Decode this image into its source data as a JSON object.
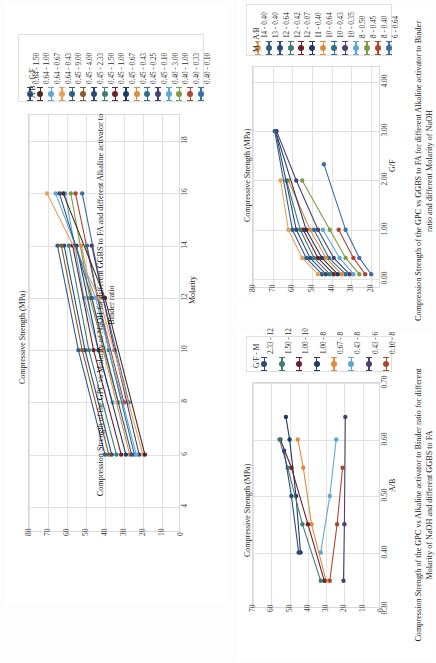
{
  "page": {
    "background": "#ffffff",
    "orientation": "rotated-90",
    "palette": [
      "#3a6fa8",
      "#b0442e",
      "#7e9b46",
      "#5fa8d3",
      "#4b3f72",
      "#2f6d8e",
      "#e08a3c",
      "#1f3b63",
      "#6e1f2a",
      "#3d7d74",
      "#2d4a7a",
      "#8a5a2b",
      "#2e5f8a",
      "#a23d2e",
      "#6b8f3a",
      "#79add6",
      "#e8a05c",
      "#4a2d1f",
      "#35538a",
      "#5ea0c9"
    ]
  },
  "chart_data": [
    {
      "id": "chart-1",
      "type": "line",
      "title": "",
      "caption": "Compression Strength of the GPC vs Molarity of NaOH for different GGBS to FA and different Alkaline activator to Binder ratio",
      "xlabel": "Molarity",
      "ylabel": "Compressive Strength (MPa)",
      "xticks": [
        4,
        6,
        8,
        10,
        12,
        14,
        16,
        18
      ],
      "yticks": [
        0,
        10,
        20,
        30,
        40,
        50,
        60,
        70,
        80
      ],
      "xlim": [
        3,
        19
      ],
      "ylim": [
        0,
        80
      ],
      "grid": true,
      "legend_title": "A/B - G/F",
      "legend_position": "top",
      "series": [
        {
          "name": "0.40 - 0.10",
          "color": "#3a6fa8",
          "x": [
            8,
            12,
            16
          ],
          "y": [
            27.5,
            41.0,
            52.0
          ]
        },
        {
          "name": "0.40 - 0.33",
          "color": "#b0442e",
          "x": [
            8,
            12,
            16
          ],
          "y": [
            30.0,
            44.0,
            55.5
          ]
        },
        {
          "name": "0.40 - 1.00",
          "color": "#7e9b46",
          "x": [
            8,
            12,
            16
          ],
          "y": [
            33.0,
            48.0,
            58.0
          ]
        },
        {
          "name": "0.40 - 3.00",
          "color": "#5fa8d3",
          "x": [
            8,
            12,
            16
          ],
          "y": [
            36.0,
            51.0,
            61.0
          ]
        },
        {
          "name": "0.45 - 0.10",
          "color": "#4b3f72",
          "x": [
            6,
            10,
            14
          ],
          "y": [
            22.0,
            35.0,
            47.0
          ]
        },
        {
          "name": "0.45 - 0.25",
          "color": "#2f6d8e",
          "x": [
            6,
            10,
            14
          ],
          "y": [
            24.5,
            38.0,
            49.5
          ]
        },
        {
          "name": "0.45 - 0.43",
          "color": "#e08a3c",
          "x": [
            6,
            10,
            14
          ],
          "y": [
            27.0,
            41.0,
            52.5
          ]
        },
        {
          "name": "0.45 - 0.67",
          "color": "#1f3b63",
          "x": [
            6,
            10,
            14
          ],
          "y": [
            29.0,
            43.5,
            55.0
          ]
        },
        {
          "name": "0.45 - 1.00",
          "color": "#6e1f2a",
          "x": [
            6,
            10,
            14
          ],
          "y": [
            31.5,
            46.0,
            57.0
          ]
        },
        {
          "name": "0.45 - 1.50",
          "color": "#3d7d74",
          "x": [
            6,
            10,
            14
          ],
          "y": [
            34.0,
            48.5,
            59.0
          ]
        },
        {
          "name": "0.45 - 2.33",
          "color": "#2d4a7a",
          "x": [
            6,
            10,
            14
          ],
          "y": [
            36.5,
            50.5,
            61.5
          ]
        },
        {
          "name": "0.45 - 4.00",
          "color": "#8a5a2b",
          "x": [
            6,
            10,
            14
          ],
          "y": [
            38.0,
            52.0,
            63.0
          ]
        },
        {
          "name": "0.45 - 9.00",
          "color": "#2e5f8a",
          "x": [
            6,
            10,
            14
          ],
          "y": [
            40.0,
            54.0,
            65.0
          ]
        },
        {
          "name": "0.64 - 0.43",
          "color": "#e8a05c",
          "x": [
            6,
            12,
            16
          ],
          "y": [
            20.0,
            43.0,
            70.5
          ]
        },
        {
          "name": "0.64 - 0.67",
          "color": "#5fa8d3",
          "x": [
            6,
            12,
            16
          ],
          "y": [
            23.5,
            45.0,
            66.0
          ]
        },
        {
          "name": "0.64 - 1.00",
          "color": "#4a2d1f",
          "x": [
            6,
            12,
            16
          ],
          "y": [
            19.0,
            40.0,
            62.0
          ]
        },
        {
          "name": "0.64 - 1.50",
          "color": "#35538a",
          "x": [
            6,
            12,
            16
          ],
          "y": [
            26.0,
            47.0,
            64.0
          ]
        }
      ]
    },
    {
      "id": "chart-2",
      "type": "line",
      "title": "",
      "caption": "Compression Strength of the GPC vs GGBS to FA for different Alkaline activator to Binder ratio and different Molarity of NaOH",
      "xlabel": "G/F",
      "ylabel": "Compressive Strength (MPa)",
      "xticks": [
        "0.00",
        "1.00",
        "2.00",
        "3.00",
        "4.00"
      ],
      "yticks": [
        20,
        30,
        40,
        50,
        60,
        70,
        80
      ],
      "xlim": [
        -0.2,
        4.3
      ],
      "ylim": [
        15,
        80
      ],
      "grid": true,
      "legend_title": "M - A/B",
      "legend_position": "top",
      "series": [
        {
          "name": "6 - 0.64",
          "color": "#3a6fa8",
          "x": [
            0.1,
            0.43,
            1.0,
            2.33
          ],
          "y": [
            20.0,
            26.0,
            33.0,
            44.0
          ]
        },
        {
          "name": "8 - 0.40",
          "color": "#b0442e",
          "x": [
            0.1,
            0.43,
            1.0
          ],
          "y": [
            23.0,
            29.0,
            36.5
          ]
        },
        {
          "name": "8 - 0.45",
          "color": "#7e9b46",
          "x": [
            0.1,
            0.43,
            1.0,
            2.0
          ],
          "y": [
            26.0,
            33.0,
            41.0,
            55.0
          ]
        },
        {
          "name": "8 - 0.50",
          "color": "#5fa8d3",
          "x": [
            0.1,
            0.43,
            1.0
          ],
          "y": [
            29.0,
            36.0,
            44.5
          ]
        },
        {
          "name": "10 - 0.35",
          "color": "#4b3f72",
          "x": [
            0.1,
            0.43,
            1.0,
            2.0,
            3.0
          ],
          "y": [
            31.0,
            39.0,
            47.0,
            58.0,
            68.0
          ]
        },
        {
          "name": "10 - 0.43",
          "color": "#2f6d8e",
          "x": [
            0.1,
            0.43,
            1.0
          ],
          "y": [
            33.0,
            41.5,
            49.0
          ]
        },
        {
          "name": "10 - 0.64",
          "color": "#e08a3c",
          "x": [
            0.1,
            0.43,
            1.0,
            2.0
          ],
          "y": [
            35.0,
            43.0,
            51.0,
            62.0
          ]
        },
        {
          "name": "11 - 0.40",
          "color": "#1f3b63",
          "x": [
            0.1,
            0.43,
            1.0,
            3.0
          ],
          "y": [
            37.0,
            45.0,
            53.0,
            68.5
          ]
        },
        {
          "name": "12 - 0.07",
          "color": "#6e1f2a",
          "x": [
            0.1,
            0.43,
            1.0
          ],
          "y": [
            39.0,
            47.0,
            54.5
          ]
        },
        {
          "name": "12 - 0.42",
          "color": "#3d7d74",
          "x": [
            0.1,
            0.43,
            1.0,
            2.0
          ],
          "y": [
            41.0,
            49.0,
            56.0,
            63.0
          ]
        },
        {
          "name": "12 - 0.64",
          "color": "#2d4a7a",
          "x": [
            0.1,
            0.43,
            1.0,
            3.0
          ],
          "y": [
            43.0,
            51.0,
            58.0,
            68.5
          ]
        },
        {
          "name": "13 - 0.40",
          "color": "#2e5f8a",
          "x": [
            0.1,
            0.43,
            1.0,
            3.0
          ],
          "y": [
            45.0,
            53.0,
            60.0,
            69.0
          ]
        },
        {
          "name": "14 - 0.40",
          "color": "#e8a05c",
          "x": [
            0.1,
            0.43,
            1.0,
            2.0
          ],
          "y": [
            47.0,
            55.0,
            62.0,
            66.0
          ]
        }
      ]
    },
    {
      "id": "chart-3",
      "type": "line",
      "title": "",
      "caption": "Compression Strength of the GPC vs Alkaline activator to Binder ratio for different Molarity of NaOH and different GGBS to FA",
      "xlabel": "A/B",
      "ylabel": "Compressive Strength (MPa)",
      "xticks": [
        "0.30",
        "0.40",
        "0.50",
        "0.60",
        "0.70"
      ],
      "yticks": [
        0,
        10,
        20,
        30,
        40,
        50,
        60,
        70
      ],
      "xlim": [
        0.3,
        0.7
      ],
      "ylim": [
        0,
        70
      ],
      "grid": true,
      "legend_title": "G/F - M",
      "legend_position": "top",
      "series": [
        {
          "name": "0.10 - 8",
          "color": "#b0442e",
          "x": [
            0.35,
            0.45,
            0.55
          ],
          "y": [
            28.0,
            24.0,
            21.0
          ]
        },
        {
          "name": "0.43 - 6",
          "color": "#4b3f72",
          "x": [
            0.35,
            0.45,
            0.64
          ],
          "y": [
            20.5,
            20.0,
            19.5
          ]
        },
        {
          "name": "0.43 - 8",
          "color": "#5fa8d3",
          "x": [
            0.4,
            0.5,
            0.6
          ],
          "y": [
            33.0,
            28.0,
            24.5
          ]
        },
        {
          "name": "0.67 - 8",
          "color": "#e08a3c",
          "x": [
            0.35,
            0.45,
            0.55,
            0.6
          ],
          "y": [
            30.0,
            38.0,
            42.5,
            45.5
          ]
        },
        {
          "name": "1.00 - 8",
          "color": "#1f3b63",
          "x": [
            0.4,
            0.5,
            0.6,
            0.64
          ],
          "y": [
            44.0,
            46.5,
            50.0,
            52.0
          ]
        },
        {
          "name": "1.00 - 10",
          "color": "#6e1f2a",
          "x": [
            0.35,
            0.45,
            0.55,
            0.6
          ],
          "y": [
            31.0,
            40.0,
            49.0,
            55.0
          ]
        },
        {
          "name": "1.50 - 12",
          "color": "#3d7d74",
          "x": [
            0.35,
            0.45,
            0.55,
            0.6
          ],
          "y": [
            33.0,
            43.0,
            51.0,
            55.5
          ]
        },
        {
          "name": "2.33 - 12",
          "color": "#2d4a7a",
          "x": [
            0.4,
            0.5,
            0.58
          ],
          "y": [
            45.0,
            49.0,
            53.0
          ]
        }
      ]
    }
  ]
}
